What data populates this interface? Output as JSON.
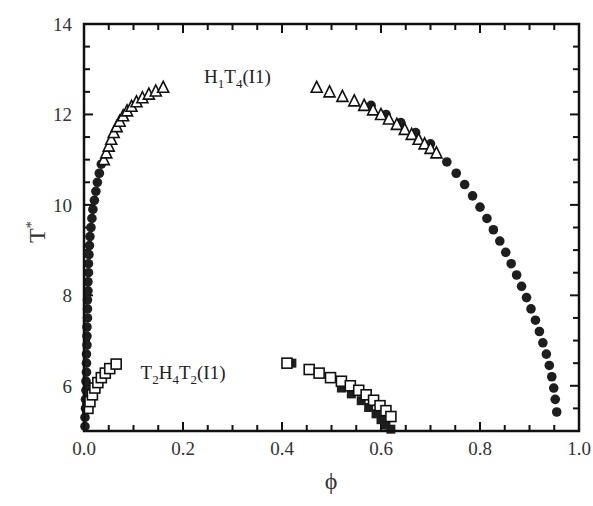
{
  "chart_data": {
    "type": "scatter",
    "title": "",
    "xlabel": "ϕ",
    "ylabel": "T*",
    "xlim": [
      0.0,
      1.0
    ],
    "ylim": [
      5.0,
      14.0
    ],
    "grid": false,
    "legend": null,
    "x_ticks": [
      "0.0",
      "0.2",
      "0.4",
      "0.6",
      "0.8",
      "1.0"
    ],
    "x_tick_values": [
      0.0,
      0.2,
      0.4,
      0.6,
      0.8,
      1.0
    ],
    "y_ticks": [
      "6",
      "8",
      "10",
      "12",
      "14"
    ],
    "y_tick_values": [
      6,
      8,
      10,
      12,
      14
    ],
    "annotations": [
      {
        "text": "H1T4(I1)",
        "x": 0.31,
        "y": 12.7,
        "parts": [
          {
            "t": "H"
          },
          {
            "t": "1",
            "sub": true
          },
          {
            "t": "T"
          },
          {
            "t": "4",
            "sub": true
          },
          {
            "t": "(I1)"
          }
        ]
      },
      {
        "text": "T2H4T2(I1)",
        "x": 0.2,
        "y": 6.15,
        "parts": [
          {
            "t": "T"
          },
          {
            "t": "2",
            "sub": true
          },
          {
            "t": "H"
          },
          {
            "t": "4",
            "sub": true
          },
          {
            "t": "T"
          },
          {
            "t": "2",
            "sub": true
          },
          {
            "t": "(I1)"
          }
        ]
      }
    ],
    "series": [
      {
        "name": "H1T4 filled circles (left)",
        "marker": "circle-filled",
        "points": [
          [
            0.002,
            5.1
          ],
          [
            0.002,
            5.3
          ],
          [
            0.003,
            5.5
          ],
          [
            0.003,
            5.7
          ],
          [
            0.004,
            5.9
          ],
          [
            0.004,
            6.1
          ],
          [
            0.005,
            6.3
          ],
          [
            0.005,
            6.5
          ],
          [
            0.005,
            6.7
          ],
          [
            0.006,
            6.9
          ],
          [
            0.006,
            7.1
          ],
          [
            0.006,
            7.3
          ],
          [
            0.007,
            7.5
          ],
          [
            0.007,
            7.7
          ],
          [
            0.007,
            7.9
          ],
          [
            0.008,
            8.1
          ],
          [
            0.008,
            8.3
          ],
          [
            0.009,
            8.5
          ],
          [
            0.009,
            8.7
          ],
          [
            0.01,
            8.9
          ],
          [
            0.011,
            9.1
          ],
          [
            0.012,
            9.3
          ],
          [
            0.014,
            9.5
          ],
          [
            0.016,
            9.7
          ],
          [
            0.018,
            9.9
          ],
          [
            0.021,
            10.1
          ],
          [
            0.024,
            10.3
          ],
          [
            0.027,
            10.5
          ],
          [
            0.031,
            10.7
          ],
          [
            0.035,
            10.9
          ]
        ]
      },
      {
        "name": "H1T4 open triangles (left)",
        "marker": "triangle-open",
        "points": [
          [
            0.04,
            11.0
          ],
          [
            0.045,
            11.15
          ],
          [
            0.05,
            11.3
          ],
          [
            0.055,
            11.45
          ],
          [
            0.06,
            11.6
          ],
          [
            0.066,
            11.73
          ],
          [
            0.072,
            11.85
          ],
          [
            0.079,
            11.97
          ],
          [
            0.087,
            12.08
          ],
          [
            0.096,
            12.18
          ],
          [
            0.106,
            12.28
          ],
          [
            0.118,
            12.37
          ],
          [
            0.131,
            12.45
          ],
          [
            0.145,
            12.52
          ],
          [
            0.16,
            12.6
          ]
        ]
      },
      {
        "name": "H1T4 filled circles (right, under triangles)",
        "marker": "circle-filled",
        "points": [
          [
            0.58,
            12.2
          ],
          [
            0.61,
            12.0
          ],
          [
            0.64,
            11.82
          ],
          [
            0.67,
            11.6
          ],
          [
            0.7,
            11.35
          ]
        ]
      },
      {
        "name": "H1T4 open triangles (right)",
        "marker": "triangle-open",
        "points": [
          [
            0.47,
            12.6
          ],
          [
            0.496,
            12.5
          ],
          [
            0.522,
            12.4
          ],
          [
            0.546,
            12.3
          ],
          [
            0.566,
            12.2
          ],
          [
            0.584,
            12.1
          ],
          [
            0.6,
            12.0
          ],
          [
            0.616,
            11.9
          ],
          [
            0.632,
            11.78
          ],
          [
            0.648,
            11.67
          ],
          [
            0.662,
            11.56
          ],
          [
            0.676,
            11.45
          ],
          [
            0.688,
            11.35
          ],
          [
            0.7,
            11.25
          ],
          [
            0.712,
            11.15
          ]
        ]
      },
      {
        "name": "H1T4 filled circles (right)",
        "marker": "circle-filled",
        "points": [
          [
            0.733,
            10.95
          ],
          [
            0.752,
            10.7
          ],
          [
            0.769,
            10.45
          ],
          [
            0.785,
            10.2
          ],
          [
            0.8,
            9.95
          ],
          [
            0.814,
            9.7
          ],
          [
            0.827,
            9.45
          ],
          [
            0.84,
            9.2
          ],
          [
            0.852,
            8.95
          ],
          [
            0.863,
            8.7
          ],
          [
            0.874,
            8.45
          ],
          [
            0.884,
            8.2
          ],
          [
            0.894,
            7.95
          ],
          [
            0.903,
            7.7
          ],
          [
            0.912,
            7.45
          ],
          [
            0.92,
            7.2
          ],
          [
            0.927,
            6.95
          ],
          [
            0.934,
            6.7
          ],
          [
            0.94,
            6.45
          ],
          [
            0.945,
            6.2
          ],
          [
            0.949,
            5.95
          ],
          [
            0.952,
            5.7
          ],
          [
            0.955,
            5.42
          ]
        ]
      },
      {
        "name": "T2H4T2 open squares (left)",
        "marker": "square-open",
        "points": [
          [
            0.008,
            5.5
          ],
          [
            0.012,
            5.65
          ],
          [
            0.017,
            5.8
          ],
          [
            0.022,
            5.95
          ],
          [
            0.028,
            6.07
          ],
          [
            0.035,
            6.18
          ],
          [
            0.043,
            6.28
          ],
          [
            0.052,
            6.38
          ],
          [
            0.065,
            6.48
          ]
        ]
      },
      {
        "name": "T2H4T2 filled squares (right)",
        "marker": "square-filled",
        "points": [
          [
            0.42,
            6.5
          ],
          [
            0.52,
            5.95
          ],
          [
            0.54,
            5.82
          ],
          [
            0.56,
            5.67
          ],
          [
            0.575,
            5.52
          ],
          [
            0.59,
            5.38
          ],
          [
            0.6,
            5.25
          ],
          [
            0.61,
            5.13
          ],
          [
            0.62,
            5.04
          ]
        ]
      },
      {
        "name": "T2H4T2 open squares (right)",
        "marker": "square-open",
        "points": [
          [
            0.41,
            6.5
          ],
          [
            0.455,
            6.36
          ],
          [
            0.475,
            6.28
          ],
          [
            0.498,
            6.18
          ],
          [
            0.52,
            6.1
          ],
          [
            0.538,
            6.0
          ],
          [
            0.555,
            5.9
          ],
          [
            0.57,
            5.8
          ],
          [
            0.585,
            5.68
          ],
          [
            0.598,
            5.56
          ],
          [
            0.61,
            5.45
          ],
          [
            0.62,
            5.32
          ]
        ]
      }
    ]
  },
  "axes": {
    "xlabel": "ϕ",
    "ylabel_main": "T",
    "ylabel_sup": "*"
  }
}
